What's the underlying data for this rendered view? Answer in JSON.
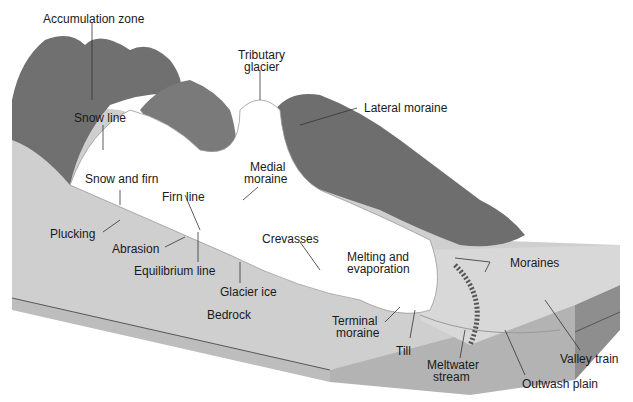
{
  "diagram": {
    "labels": {
      "accumulation_zone": "Accumulation zone",
      "tributary_glacier_1": "Tributary",
      "tributary_glacier_2": "glacier",
      "lateral_moraine": "Lateral moraine",
      "snow_line": "Snow line",
      "snow_and_firn": "Snow and firn",
      "medial_moraine_1": "Medial",
      "medial_moraine_2": "moraine",
      "firn_line": "Firn line",
      "plucking": "Plucking",
      "abrasion": "Abrasion",
      "crevasses": "Crevasses",
      "equilibrium_line": "Equilibrium line",
      "melting_1": "Melting and",
      "melting_2": "evaporation",
      "moraines": "Moraines",
      "glacier_ice": "Glacier ice",
      "bedrock": "Bedrock",
      "terminal_moraine_1": "Terminal",
      "terminal_moraine_2": "moraine",
      "till": "Till",
      "meltwater_1": "Meltwater",
      "meltwater_2": "stream",
      "valley_train": "Valley train",
      "outwash_plain": "Outwash plain"
    },
    "colors": {
      "mountain": "#6f6f6f",
      "mountain_light": "#8a8a8a",
      "bedrock_top": "#cfcfcf",
      "bedrock_side": "#a6a6a6",
      "ice": "#ffffff",
      "leader": "#333333"
    }
  }
}
